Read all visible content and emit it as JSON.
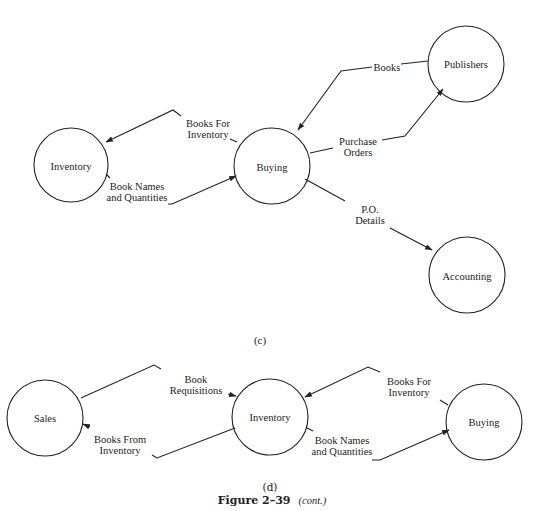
{
  "diagram_c": {
    "caption": "(c)",
    "nodes": [
      {
        "id": "inventory",
        "label": "Inventory"
      },
      {
        "id": "buying",
        "label": "Buying"
      },
      {
        "id": "publishers",
        "label": "Publishers"
      },
      {
        "id": "accounting",
        "label": "Accounting"
      }
    ],
    "flows": [
      {
        "from": "buying",
        "to": "inventory",
        "label_line1": "Books For",
        "label_line2": "Inventory"
      },
      {
        "from": "inventory",
        "to": "buying",
        "label_line1": "Book Names",
        "label_line2": "and Quantities"
      },
      {
        "from": "publishers",
        "to": "buying",
        "label_line1": "Books"
      },
      {
        "from": "buying",
        "to": "publishers",
        "label_line1": "Purchase",
        "label_line2": "Orders"
      },
      {
        "from": "buying",
        "to": "accounting",
        "label_line1": "P.O.",
        "label_line2": "Details"
      }
    ]
  },
  "diagram_d": {
    "caption": "(d)",
    "nodes": [
      {
        "id": "sales",
        "label": "Sales"
      },
      {
        "id": "inventory",
        "label": "Inventory"
      },
      {
        "id": "buying",
        "label": "Buying"
      }
    ],
    "flows": [
      {
        "from": "sales",
        "to": "inventory",
        "label_line1": "Book",
        "label_line2": "Requisitions"
      },
      {
        "from": "inventory",
        "to": "sales",
        "label_line1": "Books From",
        "label_line2": "Inventory"
      },
      {
        "from": "buying",
        "to": "inventory",
        "label_line1": "Books For",
        "label_line2": "Inventory"
      },
      {
        "from": "inventory",
        "to": "buying",
        "label_line1": "Book Names",
        "label_line2": "and Quantities"
      }
    ]
  },
  "figure": {
    "number": "Figure 2–39",
    "suffix": "(cont.)"
  },
  "colors": {
    "stroke": "#222222",
    "background": "#ffffff"
  }
}
